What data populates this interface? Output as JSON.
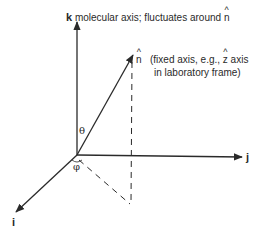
{
  "diagram": {
    "axes": {
      "k": {
        "label": "k",
        "description": "molecular axis; fluctuates around",
        "description_symbol": "n"
      },
      "j": {
        "label": "j"
      },
      "i": {
        "label": "i"
      }
    },
    "vector_n": {
      "symbol": "n",
      "note_open": "(fixed axis, e.g.,",
      "note_symbol": "z",
      "note_after_symbol": "axis",
      "note_line2": "in laboratory frame)"
    },
    "angles": {
      "theta": "θ",
      "phi": "φ"
    },
    "colors": {
      "stroke": "#2a2a2a",
      "background": "#ffffff"
    }
  }
}
